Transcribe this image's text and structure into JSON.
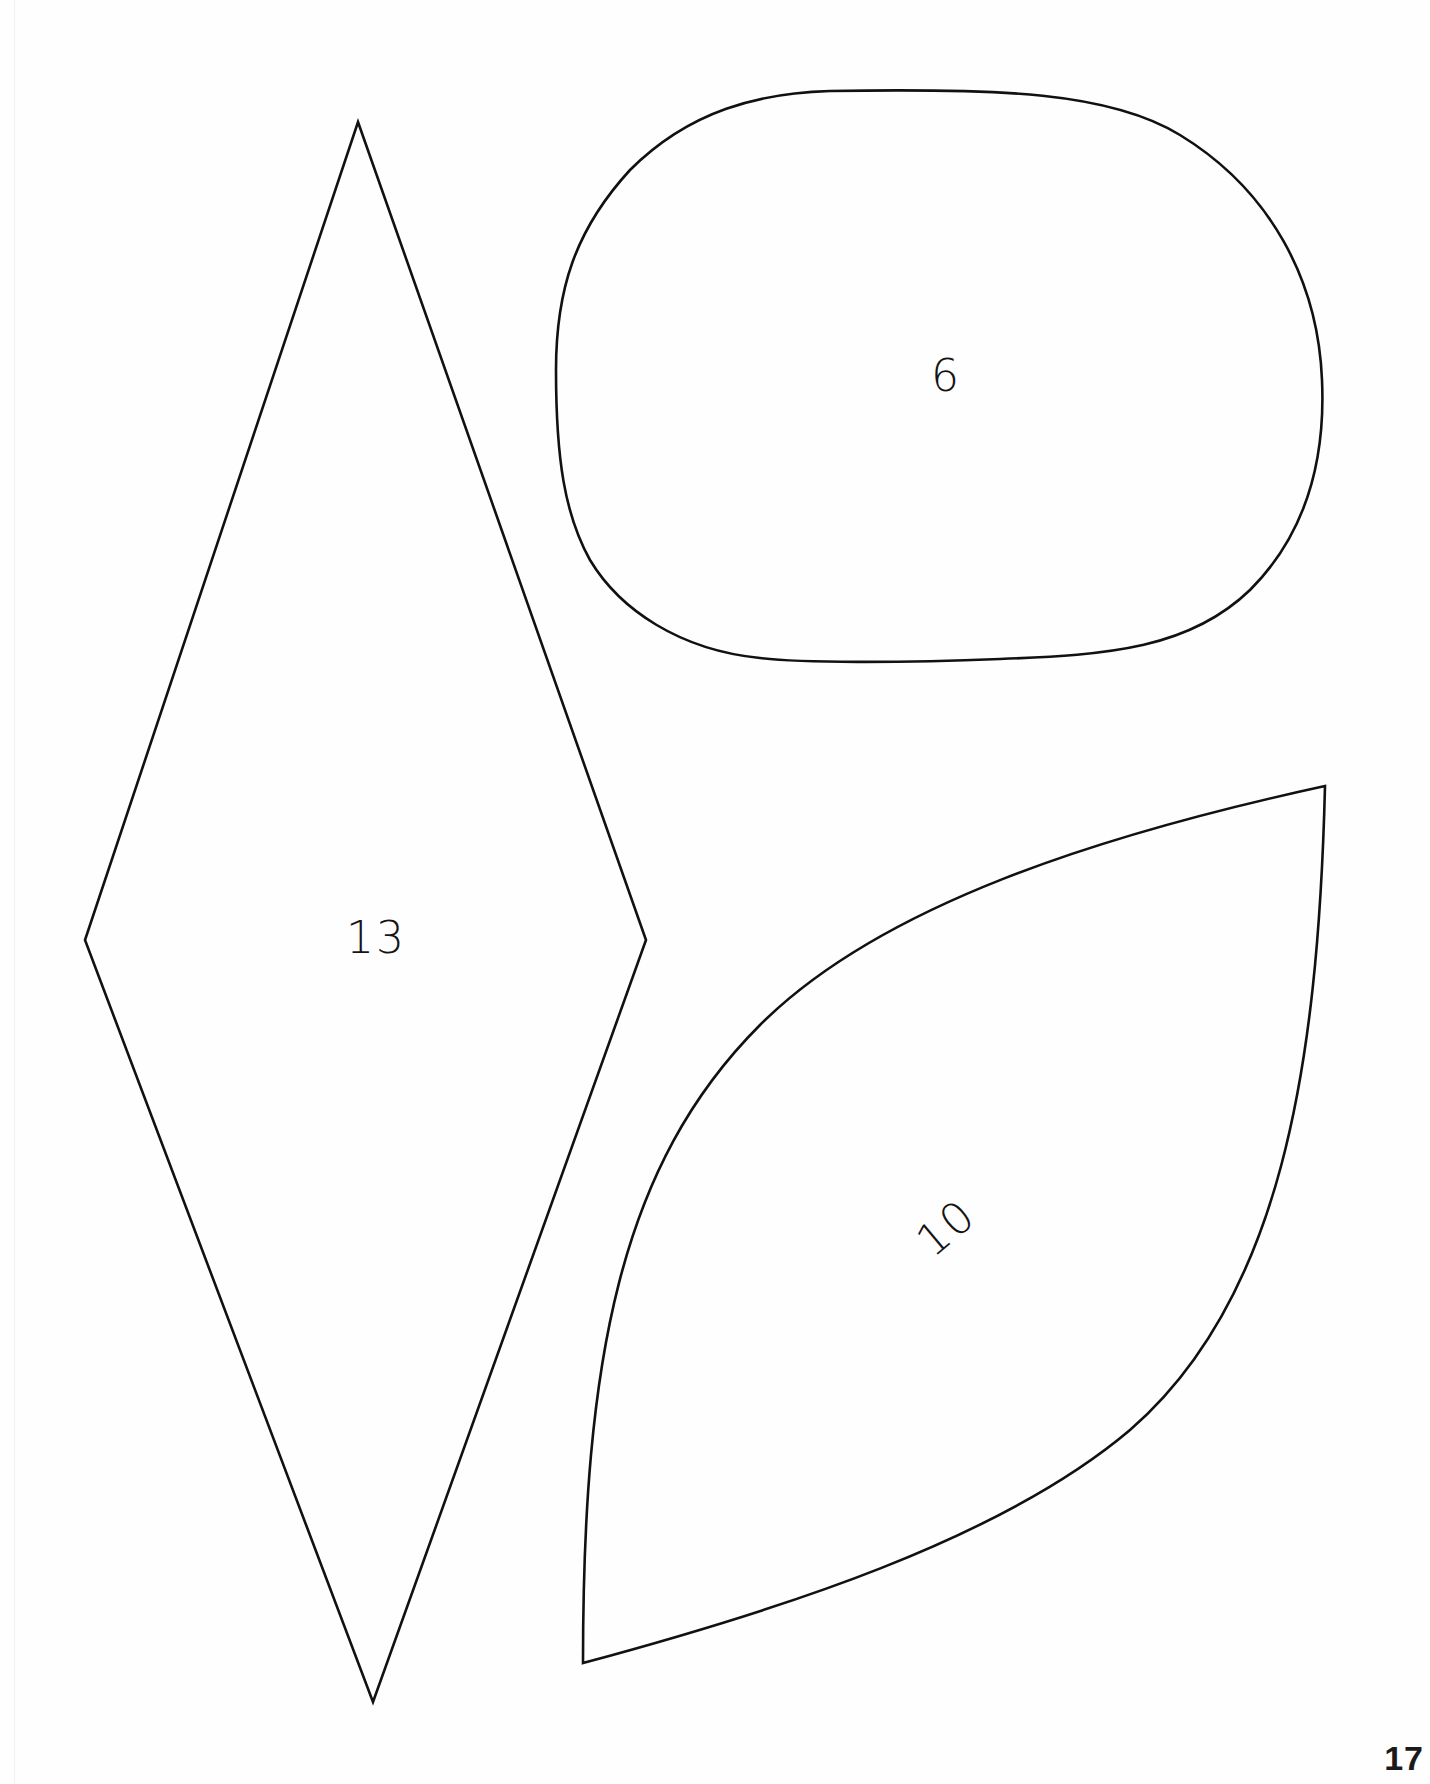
{
  "page": {
    "page_number": "17",
    "background": "#ffffff",
    "line_color": "#111111"
  },
  "shapes": [
    {
      "id": "diamond",
      "type": "rhombus",
      "label": "13",
      "vertices": {
        "top": [
          358,
          122
        ],
        "right": [
          646,
          940
        ],
        "bottom": [
          373,
          1702
        ],
        "left": [
          85,
          940
        ]
      }
    },
    {
      "id": "oval",
      "type": "rounded-oval",
      "label": "6",
      "bounds": {
        "left": 556,
        "top": 90,
        "right": 1323,
        "bottom": 661
      }
    },
    {
      "id": "leaf",
      "type": "leaf-petal",
      "label": "10",
      "tips": {
        "top_right": [
          1325,
          786
        ],
        "bottom_left": [
          583,
          1663
        ]
      }
    }
  ]
}
